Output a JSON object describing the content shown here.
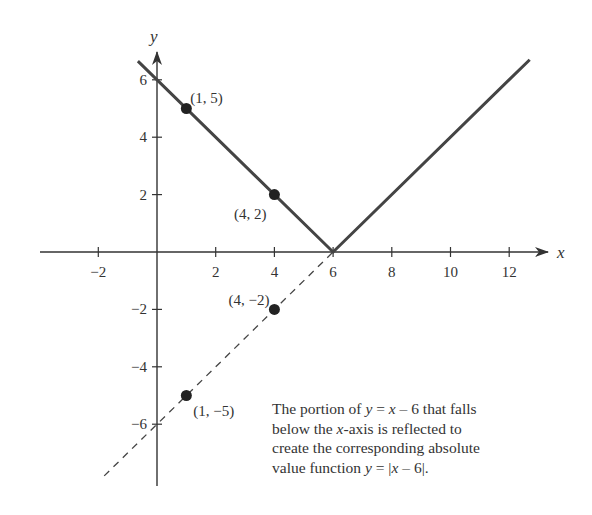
{
  "chart_data": {
    "type": "line",
    "title": "",
    "xlabel": "x",
    "ylabel": "y",
    "xlim": [
      -3.9,
      13.5
    ],
    "ylim": [
      -8.1,
      6.9
    ],
    "grid": false,
    "x_ticks": [
      -2,
      2,
      4,
      6,
      8,
      10,
      12
    ],
    "x_tick_labels": [
      "−2",
      "2",
      "4",
      "6",
      "8",
      "10",
      "12"
    ],
    "y_ticks": [
      -6,
      -4,
      -2,
      2,
      4,
      6
    ],
    "y_tick_labels": [
      "−6",
      "−4",
      "−2",
      "2",
      "4",
      "6"
    ],
    "series": [
      {
        "name": "y = |x − 6|",
        "style": "solid",
        "color": "#444444",
        "x": [
          -0.65,
          6,
          12.7
        ],
        "y": [
          6.65,
          0,
          6.7
        ]
      },
      {
        "name": "y = x − 6 (portion below x-axis)",
        "style": "dashed",
        "color": "#444444",
        "x": [
          -1.8,
          6
        ],
        "y": [
          -7.8,
          0
        ]
      }
    ],
    "points": [
      {
        "x": 1,
        "y": 5,
        "label": "(1, 5)"
      },
      {
        "x": 4,
        "y": 2,
        "label": "(4, 2)"
      },
      {
        "x": 4,
        "y": -2,
        "label": "(4, −2)"
      },
      {
        "x": 1,
        "y": -5,
        "label": "(1, −5)"
      }
    ],
    "annotation": [
      "The portion of y = x − 6 that falls",
      "below the x-axis is reflected to",
      "create the corresponding absolute",
      "value function y = |x − 6|."
    ]
  },
  "caption": {
    "line1_a": "The portion of ",
    "line1_b": "y",
    "line1_c": " = ",
    "line1_d": "x",
    "line1_e": " – 6 that falls",
    "line2_a": "below the ",
    "line2_b": "x",
    "line2_c": "-axis is reflected to",
    "line3": "create the corresponding absolute",
    "line4_a": "value function ",
    "line4_b": "y",
    "line4_c": " = |",
    "line4_d": "x",
    "line4_e": " – 6|."
  }
}
